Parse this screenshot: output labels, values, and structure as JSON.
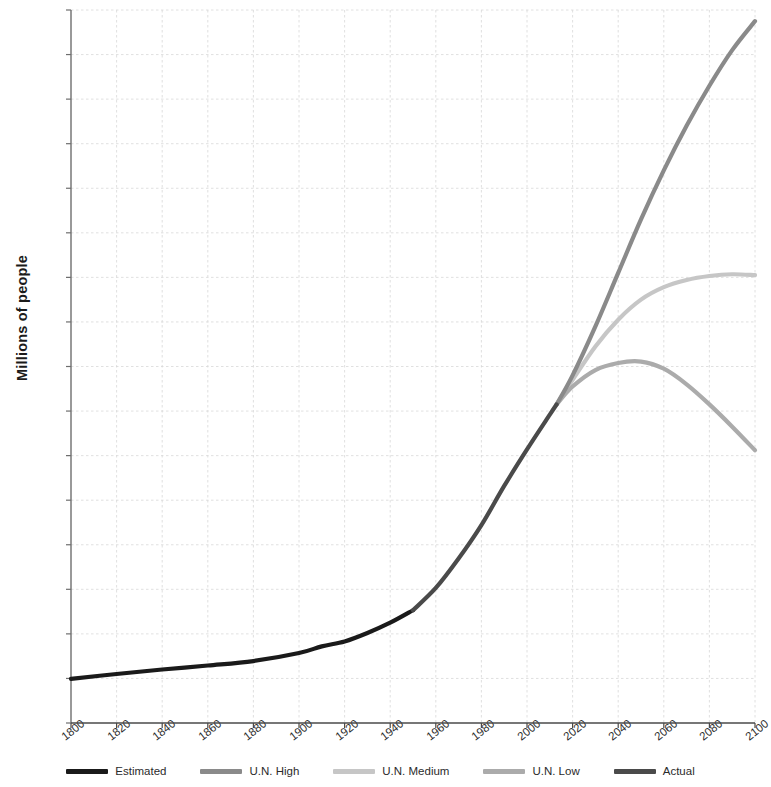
{
  "chart_data": {
    "type": "line",
    "title": "",
    "xlabel": "",
    "ylabel": "Millions of people",
    "xlim": [
      1800,
      2100
    ],
    "ylim": [
      0,
      16000
    ],
    "xticks": [
      1800,
      1820,
      1840,
      1860,
      1880,
      1900,
      1920,
      1940,
      1960,
      1980,
      2000,
      2020,
      2040,
      2060,
      2080,
      2100
    ],
    "yticks": [
      0,
      1000,
      2000,
      3000,
      4000,
      5000,
      6000,
      7000,
      8000,
      9000,
      10000,
      11000,
      12000,
      13000,
      14000,
      15000,
      16000
    ],
    "grid": true,
    "legend_position": "bottom",
    "series": [
      {
        "name": "Estimated",
        "color": "#1a1a1a",
        "x": [
          1800,
          1820,
          1840,
          1860,
          1880,
          1900,
          1910,
          1920,
          1930,
          1940,
          1950
        ],
        "values": [
          990,
          1100,
          1200,
          1290,
          1390,
          1570,
          1720,
          1830,
          2020,
          2250,
          2530
        ]
      },
      {
        "name": "Actual",
        "color": "#4a4a4a",
        "x": [
          1950,
          1960,
          1970,
          1980,
          1990,
          2000,
          2010,
          2013
        ],
        "values": [
          2530,
          3030,
          3690,
          4440,
          5320,
          6140,
          6920,
          7150
        ]
      },
      {
        "name": "U.N. High",
        "color": "#8a8a8a",
        "x": [
          2013,
          2020,
          2030,
          2040,
          2050,
          2060,
          2070,
          2080,
          2090,
          2100
        ],
        "values": [
          7150,
          7800,
          8900,
          10100,
          11300,
          12400,
          13400,
          14300,
          15100,
          15750
        ]
      },
      {
        "name": "U.N. Medium",
        "color": "#c6c6c6",
        "x": [
          2013,
          2020,
          2030,
          2040,
          2050,
          2060,
          2070,
          2080,
          2090,
          2100
        ],
        "values": [
          7150,
          7700,
          8450,
          9050,
          9500,
          9780,
          9940,
          10030,
          10070,
          10050
        ]
      },
      {
        "name": "U.N. Low",
        "color": "#ababab",
        "x": [
          2013,
          2020,
          2030,
          2040,
          2050,
          2060,
          2070,
          2080,
          2090,
          2100
        ],
        "values": [
          7150,
          7550,
          7920,
          8080,
          8110,
          7950,
          7600,
          7150,
          6650,
          6120
        ]
      }
    ]
  },
  "axis": {
    "y_title": "Millions of people"
  },
  "legend": {
    "items": [
      {
        "label": "Estimated",
        "color": "#1a1a1a"
      },
      {
        "label": "U.N. High",
        "color": "#8a8a8a"
      },
      {
        "label": "U.N. Medium",
        "color": "#c6c6c6"
      },
      {
        "label": "U.N. Low",
        "color": "#ababab"
      },
      {
        "label": "Actual",
        "color": "#4a4a4a"
      }
    ]
  }
}
